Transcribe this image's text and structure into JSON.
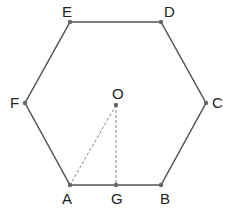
{
  "figure": {
    "type": "regular-hexagon",
    "stroke_color": "#555555",
    "point_color": "#666666",
    "points": [
      {
        "name": "A",
        "x": 70,
        "y": 185,
        "lx": 62,
        "ly": 204
      },
      {
        "name": "B",
        "x": 161,
        "y": 185,
        "lx": 160,
        "ly": 204
      },
      {
        "name": "C",
        "x": 206,
        "y": 103,
        "lx": 212,
        "ly": 108
      },
      {
        "name": "D",
        "x": 161,
        "y": 22,
        "lx": 164,
        "ly": 17
      },
      {
        "name": "E",
        "x": 70,
        "y": 22,
        "lx": 62,
        "ly": 17
      },
      {
        "name": "F",
        "x": 25,
        "y": 103,
        "lx": 10,
        "ly": 108
      },
      {
        "name": "O",
        "x": 116,
        "y": 105,
        "lx": 112,
        "ly": 99
      },
      {
        "name": "G",
        "x": 116,
        "y": 185,
        "lx": 111,
        "ly": 204
      }
    ],
    "polygon": [
      "A",
      "B",
      "C",
      "D",
      "E",
      "F"
    ],
    "dashed_segments": [
      [
        "O",
        "A"
      ],
      [
        "O",
        "G"
      ]
    ]
  }
}
